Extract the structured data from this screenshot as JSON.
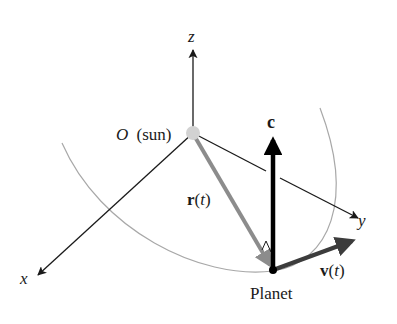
{
  "diagram": {
    "axes": {
      "x_label": "x",
      "y_label": "y",
      "z_label": "z"
    },
    "origin": {
      "symbol": "O",
      "note": "(sun)"
    },
    "vectors": {
      "position": {
        "symbol": "r",
        "arg_open": "(",
        "arg": "t",
        "arg_close": ")"
      },
      "velocity": {
        "symbol": "v",
        "arg_open": "(",
        "arg": "t",
        "arg_close": ")"
      },
      "angular_momentum": {
        "symbol": "c"
      }
    },
    "planet_label": "Planet",
    "colors": {
      "axis": "#1a1a1a",
      "orbit": "#a8a8a8",
      "position_vector": "#8c8c8c",
      "velocity_vector": "#3c3c3c",
      "angular_momentum_vector": "#000000",
      "sun": "#d2d2d2",
      "planet": "#000000"
    }
  }
}
